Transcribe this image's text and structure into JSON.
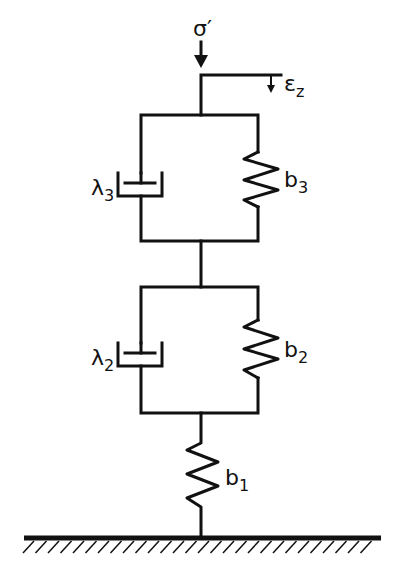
{
  "diagram": {
    "type": "rheological-model",
    "input_stress": {
      "symbol": "σ",
      "prime": "′"
    },
    "output_strain": {
      "symbol": "ε",
      "subscript": "z"
    },
    "elements": [
      {
        "id": "kelvin-3",
        "dashpot": {
          "symbol": "λ",
          "subscript": "3"
        },
        "spring": {
          "symbol": "b",
          "subscript": "3"
        }
      },
      {
        "id": "kelvin-2",
        "dashpot": {
          "symbol": "λ",
          "subscript": "2"
        },
        "spring": {
          "symbol": "b",
          "subscript": "2"
        }
      },
      {
        "id": "series-spring",
        "spring": {
          "symbol": "b",
          "subscript": "1"
        }
      }
    ],
    "ground": "fixed-support",
    "colors": {
      "ink": "#111111",
      "background": "#ffffff"
    }
  }
}
